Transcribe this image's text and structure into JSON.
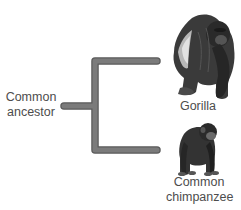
{
  "diagram": {
    "type": "phylogenetic-tree",
    "root": {
      "label_lines": [
        "Common",
        "ancestor"
      ]
    },
    "leaves": [
      {
        "id": "gorilla",
        "label_lines": [
          "Gorilla"
        ],
        "image": "gorilla-illustration"
      },
      {
        "id": "chimpanzee",
        "label_lines": [
          "Common",
          "chimpanzee"
        ],
        "image": "chimpanzee-illustration"
      }
    ],
    "colors": {
      "branch_fill": "#7b7b7b",
      "branch_outline": "#5a5a5a",
      "text": "#4d4d4d",
      "background": "#ffffff"
    }
  }
}
